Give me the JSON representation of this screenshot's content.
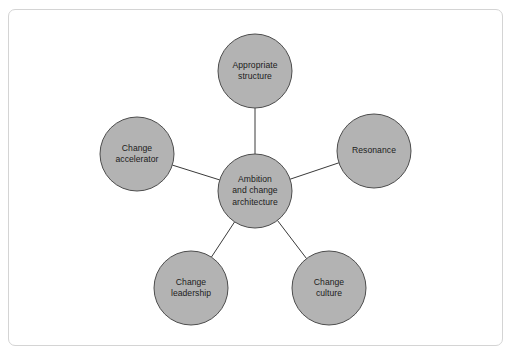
{
  "diagram": {
    "type": "hub-and-spoke",
    "frame": {
      "border_color": "#d4d4d4",
      "background_color": "#ffffff",
      "corner_radius": 7
    },
    "style": {
      "node_fill": "#b3b3b3",
      "node_stroke": "#4d4d4d",
      "node_stroke_width": 1,
      "connector_color": "#3a3a3a",
      "connector_width": 1,
      "text_color": "#1c1c1c",
      "node_radius": 37
    },
    "center_node": {
      "id": "center",
      "label": "Ambition\nand change\narchitecture",
      "cx": 255,
      "cy": 191,
      "r": 37
    },
    "spoke_nodes": [
      {
        "id": "appropriate-structure",
        "label": "Appropriate\nstructure",
        "cx": 255,
        "cy": 71,
        "r": 37,
        "position": "top"
      },
      {
        "id": "resonance",
        "label": "Resonance",
        "cx": 374,
        "cy": 151,
        "r": 37,
        "position": "right"
      },
      {
        "id": "change-culture",
        "label": "Change\nculture",
        "cx": 329,
        "cy": 288,
        "r": 37,
        "position": "bottom-right"
      },
      {
        "id": "change-leadership",
        "label": "Change\nleadership",
        "cx": 191,
        "cy": 288,
        "r": 37,
        "position": "bottom-left"
      },
      {
        "id": "change-accelerator",
        "label": "Change\naccelerator",
        "cx": 137,
        "cy": 154,
        "r": 37,
        "position": "left"
      }
    ],
    "connectors": [
      {
        "id": "center-to-appropriate-structure",
        "from": "center",
        "to": "appropriate-structure"
      },
      {
        "id": "center-to-resonance",
        "from": "center",
        "to": "resonance"
      },
      {
        "id": "center-to-change-culture",
        "from": "center",
        "to": "change-culture"
      },
      {
        "id": "center-to-change-leadership",
        "from": "center",
        "to": "change-leadership"
      },
      {
        "id": "center-to-change-accelerator",
        "from": "center",
        "to": "change-accelerator"
      }
    ]
  }
}
